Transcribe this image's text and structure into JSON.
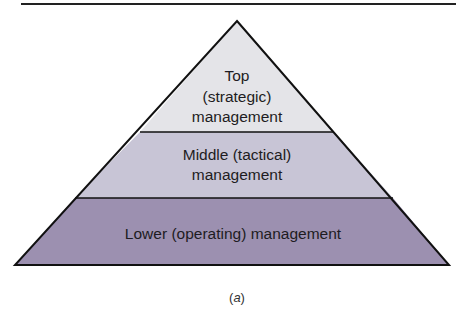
{
  "diagram": {
    "type": "pyramid",
    "levels": [
      {
        "id": "top",
        "lines": [
          "Top",
          "(strategic)",
          "management"
        ],
        "fill": "#e4e4e8"
      },
      {
        "id": "middle",
        "lines": [
          "Middle (tactical)",
          "management"
        ],
        "fill": "#c8c5d6"
      },
      {
        "id": "lower",
        "lines": [
          "Lower (operating) management"
        ],
        "fill": "#9c90b0"
      }
    ],
    "caption_open": "(",
    "caption_letter": "a",
    "caption_close": ")",
    "stroke_color": "#111111"
  }
}
